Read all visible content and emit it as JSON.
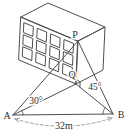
{
  "figure": {
    "background": "#ffffff",
    "stroke_color": "#4f4f4f",
    "label_color": "#2f2f2f",
    "dash_color": "#9e9e9e",
    "points": {
      "A": [
        13,
        115
      ],
      "B": [
        113,
        114
      ],
      "P": [
        78,
        41
      ],
      "Q": [
        76,
        84
      ]
    },
    "box": {
      "front": [
        [
          21,
          17
        ],
        [
          78,
          41
        ],
        [
          76,
          84
        ],
        [
          19,
          60
        ]
      ],
      "top": [
        [
          21,
          17
        ],
        [
          48,
          3
        ],
        [
          105,
          27
        ],
        [
          78,
          41
        ]
      ],
      "right": [
        [
          78,
          41
        ],
        [
          105,
          27
        ],
        [
          103,
          70
        ],
        [
          76,
          84
        ]
      ]
    },
    "windows": {
      "cols": 4,
      "rows": 3,
      "u0": 0.06,
      "du": 0.235,
      "wu": 0.16,
      "v0": 0.1,
      "dv": 0.28,
      "wv": 0.23
    },
    "sight_lines": [
      [
        "A",
        "P"
      ],
      [
        "A",
        "Q"
      ],
      [
        "A",
        "B"
      ],
      [
        "B",
        "P"
      ],
      [
        "B",
        "Q"
      ]
    ],
    "angles": [
      {
        "vertex": "A",
        "from": "B",
        "to": "Q",
        "radius": 10,
        "label": "30°",
        "label_pos": [
          36,
          104
        ]
      },
      {
        "vertex": "B",
        "from": "A",
        "to": "Q",
        "radius": 10,
        "label": "45°",
        "label_pos": [
          95,
          90
        ]
      }
    ],
    "right_angle": {
      "vertex": "Q",
      "toward1": "P",
      "toward2": "B",
      "size": 5
    },
    "distance": {
      "label": "32m",
      "label_pos": [
        64,
        129
      ],
      "arc_start": [
        15,
        119
      ],
      "arc_ctrl": [
        64,
        134
      ],
      "arc_end": [
        112,
        118
      ]
    },
    "labels": {
      "A": {
        "text": "A",
        "x": 7,
        "y": 119
      },
      "B": {
        "text": "B",
        "x": 121,
        "y": 118
      },
      "P": {
        "text": "P",
        "x": 75,
        "y": 38
      },
      "Q": {
        "text": "Q",
        "x": 72,
        "y": 78
      }
    }
  }
}
